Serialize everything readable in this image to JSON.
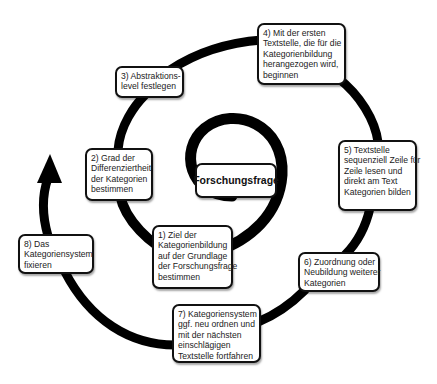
{
  "diagram": {
    "center": {
      "label": "Forschungsfrage"
    },
    "steps": [
      {
        "lines": [
          "1) Ziel der",
          "Kategorienbildung",
          "auf der Grundlage",
          "der Forschungsfrage",
          "bestimmen"
        ]
      },
      {
        "lines": [
          "2) Grad der",
          "Differenziertheit",
          "der Kategorien",
          "bestimmen"
        ]
      },
      {
        "lines": [
          "3) Abstraktions-",
          "level festlegen"
        ]
      },
      {
        "lines": [
          "4) Mit der ersten",
          "Textstelle, die für die",
          "Kategorienbildung",
          "herangezogen wird,",
          "beginnen"
        ]
      },
      {
        "lines": [
          "5) Textstelle",
          "sequenziell Zeile für",
          "Zeile lesen und",
          "direkt am Text",
          "Kategorien bilden"
        ]
      },
      {
        "lines": [
          "6) Zuordnung oder",
          "Neubildung weiterer",
          "Kategorien"
        ]
      },
      {
        "lines": [
          "7) Kategoriensystem",
          "ggf. neu ordnen und",
          "mit der nächsten",
          "einschlägigen",
          "Textstelle fortfahren"
        ]
      },
      {
        "lines": [
          "8) Das",
          "Kategoriensystem",
          "fixieren"
        ]
      }
    ],
    "colors": {
      "spiral": "#000000",
      "box_border": "#111111",
      "background": "#ffffff"
    }
  }
}
